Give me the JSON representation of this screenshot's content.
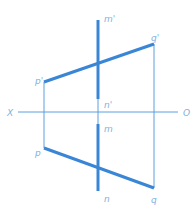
{
  "diagram": {
    "type": "orthographic-projection",
    "colors": {
      "line": "#3a86d6",
      "thin": "#5a9ee0",
      "label": "#7fb0e0"
    },
    "axis": {
      "left_label": "X",
      "right_label": "O"
    },
    "front_view": {
      "line_mn": {
        "top_label": "m'",
        "bottom_label": "n'"
      },
      "line_pq": {
        "left_label": "p'",
        "right_label": "q'"
      }
    },
    "top_view": {
      "line_mn": {
        "top_label": "m",
        "bottom_label": "n"
      },
      "line_pq": {
        "left_label": "p",
        "right_label": "q"
      }
    }
  }
}
